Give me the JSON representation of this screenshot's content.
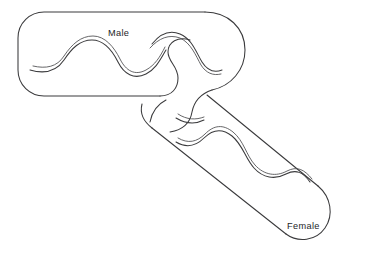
{
  "figure": {
    "type": "line-drawing",
    "background_color": "#ffffff",
    "line_color": "#3a3a3c",
    "label_color": "#1d1d1f",
    "labels": {
      "male": "Male",
      "female": "Female"
    },
    "shapes": [
      {
        "name": "male-capsule",
        "label": "Male",
        "orientation": "horizontal",
        "interior_motif": "doubled wavy flagellum line"
      },
      {
        "name": "female-capsule",
        "label": "Female",
        "orientation": "diagonal descending to lower right",
        "interior_motif": "doubled wavy flagellum line"
      },
      {
        "name": "conjugation-neck",
        "label": "",
        "orientation": "s-curve joining male and female",
        "interior_motif": "none"
      }
    ]
  },
  "caption": {
    "clipped_text": ""
  }
}
